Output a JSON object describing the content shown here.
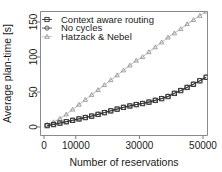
{
  "chart_data": {
    "type": "line",
    "title": "",
    "xlabel": "Number of reservations",
    "ylabel": "Average plan-time [s]",
    "xlim": [
      0,
      52000
    ],
    "ylim": [
      0,
      170
    ],
    "xticks": [
      0,
      10000,
      30000,
      50000
    ],
    "xtick_labels": [
      "0",
      "10000",
      "30000",
      "50000"
    ],
    "yticks": [
      0,
      50,
      100,
      150
    ],
    "ytick_labels": [
      "0",
      "50",
      "100",
      "150"
    ],
    "grid": false,
    "legend_position": "top-left",
    "x": [
      1000,
      3000,
      5000,
      7000,
      9000,
      11000,
      13000,
      15000,
      17000,
      19000,
      21000,
      23000,
      25000,
      27000,
      29000,
      31000,
      33000,
      35000,
      37000,
      39000,
      41000,
      43000,
      45000,
      47000,
      49000,
      51000
    ],
    "series": [
      {
        "name": "Context aware routing",
        "marker": "square",
        "color": "#333333",
        "values": [
          2.0,
          3.5,
          5.5,
          7.5,
          9.5,
          11.5,
          13.5,
          15.5,
          18.0,
          20.5,
          23.0,
          25.5,
          28.0,
          30.0,
          32.0,
          33.5,
          35.5,
          38.0,
          40.5,
          43.5,
          48.0,
          52.0,
          56.5,
          61.0,
          66.0,
          71.0
        ]
      },
      {
        "name": "No cycles",
        "marker": "circle",
        "color": "#4d4d4d",
        "values": [
          2.2,
          3.7,
          5.7,
          7.7,
          9.7,
          11.7,
          13.7,
          15.7,
          18.2,
          20.7,
          23.2,
          25.7,
          28.2,
          30.2,
          32.2,
          33.8,
          35.8,
          38.3,
          40.8,
          43.8,
          48.3,
          52.3,
          56.8,
          61.3,
          66.3,
          71.3
        ]
      },
      {
        "name": "Hatzack & Nebel",
        "marker": "triangle",
        "color": "#999999",
        "values": [
          3.0,
          7.0,
          12.0,
          18.0,
          25.0,
          32.0,
          39.0,
          46.0,
          53.0,
          60.0,
          67.0,
          74.0,
          81.0,
          88.0,
          95.0,
          100.0,
          107.0,
          114.0,
          121.0,
          128.0,
          134.0,
          140.0,
          147.0,
          153.0,
          159.0,
          165.0
        ]
      }
    ]
  },
  "legend": {
    "entries": [
      {
        "label": "Context aware routing",
        "marker": "square-marker-icon"
      },
      {
        "label": "No cycles",
        "marker": "circle-marker-icon"
      },
      {
        "label": "Hatzack & Nebel",
        "marker": "triangle-marker-icon"
      }
    ]
  }
}
